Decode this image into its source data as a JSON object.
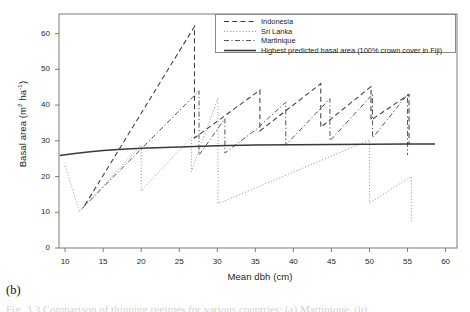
{
  "panel": {
    "label": "(b)"
  },
  "caption": {
    "text": "Fig. 3.3  Comparison of thinning regimes for various countries: (a) Martinique, (b) ..."
  },
  "axes": {
    "x": {
      "title": "Mean dbh (cm)",
      "ticks": [
        10,
        15,
        20,
        25,
        30,
        35,
        40,
        45,
        50,
        55,
        60
      ],
      "min": 9.2,
      "max": 61.5
    },
    "y": {
      "title": "Basal area (m2 ha-1)",
      "title_prefix": "Basal area (m",
      "title_sup1": "2",
      "title_mid": " ha",
      "title_sup2": "-1",
      "title_suffix": ")",
      "ticks": [
        0,
        10,
        20,
        30,
        40,
        50,
        60
      ],
      "min": 0,
      "max": 65.5
    }
  },
  "legend": {
    "entries": [
      {
        "label": "Indonesia",
        "style": "dashed",
        "color": "#3c3c3c"
      },
      {
        "label": "Sri Lanka",
        "style": "dotted",
        "color": "#9a9a9a"
      },
      {
        "label": "Martinique",
        "style": "dashdot",
        "color": "#555555"
      },
      {
        "label": "Highest predicted basal area (100% crown cover in Fiji)",
        "style": "solid",
        "color": "#3a3a3a"
      }
    ]
  },
  "chart_data": {
    "type": "line",
    "title": "",
    "xlabel": "Mean dbh (cm)",
    "ylabel": "Basal area (m2 ha-1)",
    "xlim": [
      9.2,
      61.5
    ],
    "ylim": [
      0,
      65.5
    ],
    "grid": false,
    "legend_position": "top-right",
    "series": [
      {
        "name": "Indonesia",
        "style": "dashed",
        "color": "#3c3c3c",
        "points": [
          [
            12.6,
            12.0
          ],
          [
            27.0,
            62.0
          ],
          [
            27.0,
            30.8
          ],
          [
            35.6,
            44.2
          ],
          [
            35.6,
            32.8
          ],
          [
            43.6,
            46.0
          ],
          [
            43.6,
            33.8
          ],
          [
            50.2,
            45.2
          ],
          [
            50.2,
            35.8
          ],
          [
            55.2,
            43.0
          ],
          [
            55.2,
            29.0
          ]
        ]
      },
      {
        "name": "Sri Lanka",
        "style": "dotted",
        "color": "#9a9a9a",
        "points": [
          [
            10.0,
            23.0
          ],
          [
            11.9,
            10.2
          ],
          [
            20.0,
            28.8
          ],
          [
            20.0,
            16.0
          ],
          [
            26.6,
            31.0
          ],
          [
            26.6,
            21.4
          ],
          [
            30.1,
            42.0
          ],
          [
            30.1,
            12.4
          ],
          [
            50.0,
            30.2
          ],
          [
            50.0,
            12.6
          ],
          [
            55.5,
            20.0
          ],
          [
            55.5,
            7.0
          ]
        ]
      },
      {
        "name": "Martinique",
        "style": "dashdot",
        "color": "#555555",
        "points": [
          [
            12.2,
            11.0
          ],
          [
            27.6,
            44.0
          ],
          [
            27.6,
            26.0
          ],
          [
            31.0,
            36.2
          ],
          [
            31.0,
            26.6
          ],
          [
            35.0,
            33.0
          ],
          [
            39.0,
            40.8
          ],
          [
            39.0,
            28.8
          ],
          [
            44.8,
            41.8
          ],
          [
            44.8,
            30.0
          ],
          [
            50.4,
            43.0
          ],
          [
            50.4,
            30.8
          ],
          [
            55.0,
            43.0
          ],
          [
            55.0,
            26.0
          ]
        ]
      },
      {
        "name": "Highest predicted basal area (100% crown cover in Fiji)",
        "style": "solid",
        "color": "#3a3a3a",
        "points": [
          [
            9.3,
            25.9
          ],
          [
            11.0,
            26.4
          ],
          [
            13.0,
            26.9
          ],
          [
            15.0,
            27.3
          ],
          [
            18.0,
            27.7
          ],
          [
            21.0,
            28.0
          ],
          [
            25.0,
            28.3
          ],
          [
            30.0,
            28.6
          ],
          [
            35.0,
            28.8
          ],
          [
            40.0,
            28.9
          ],
          [
            45.0,
            29.0
          ],
          [
            50.0,
            29.05
          ],
          [
            55.0,
            29.1
          ],
          [
            58.6,
            29.1
          ]
        ]
      }
    ]
  }
}
